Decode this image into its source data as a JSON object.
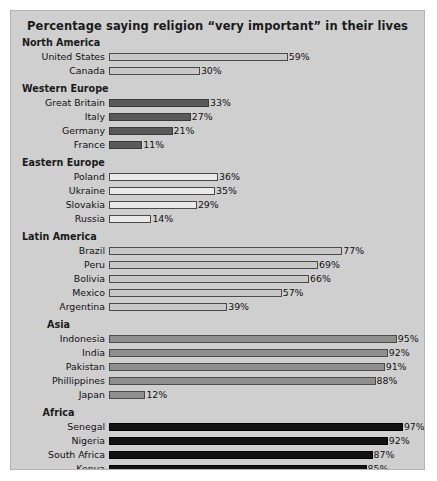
{
  "chart_data": {
    "type": "bar",
    "orientation": "horizontal",
    "title": "Percentage saying religion “very important” in their lives",
    "xlabel": "",
    "ylabel": "",
    "xlim": [
      0,
      100
    ],
    "grid": false,
    "legend": "none",
    "value_suffix": "%",
    "categories": [
      "United States",
      "Canada",
      "Great Britain",
      "Italy",
      "Germany",
      "France",
      "Poland",
      "Ukraine",
      "Slovakia",
      "Russia",
      "Brazil",
      "Peru",
      "Bolivia",
      "Mexico",
      "Argentina",
      "Indonesia",
      "India",
      "Pakistan",
      "Phillippines",
      "Japan",
      "Senegal",
      "Nigeria",
      "South Africa",
      "Kenya",
      "Uganda"
    ],
    "values": [
      59,
      30,
      33,
      27,
      21,
      11,
      36,
      35,
      29,
      14,
      77,
      69,
      66,
      57,
      39,
      95,
      92,
      91,
      88,
      12,
      97,
      92,
      87,
      85,
      85
    ],
    "groups": [
      {
        "name": "North America",
        "heading_align": "left",
        "fill": "fill-light",
        "color": "#c8c8c8",
        "rows": [
          {
            "label": "United States",
            "value": 59,
            "value_label": "59%"
          },
          {
            "label": "Canada",
            "value": 30,
            "value_label": "30%"
          }
        ]
      },
      {
        "name": "Western Europe",
        "heading_align": "left",
        "fill": "fill-dark",
        "color": "#595959",
        "rows": [
          {
            "label": "Great Britain",
            "value": 33,
            "value_label": "33%"
          },
          {
            "label": "Italy",
            "value": 27,
            "value_label": "27%"
          },
          {
            "label": "Germany",
            "value": 21,
            "value_label": "21%"
          },
          {
            "label": "France",
            "value": 11,
            "value_label": "11%"
          }
        ]
      },
      {
        "name": "Eastern Europe",
        "heading_align": "left",
        "fill": "fill-white",
        "color": "#e9e9e9",
        "rows": [
          {
            "label": "Poland",
            "value": 36,
            "value_label": "36%"
          },
          {
            "label": "Ukraine",
            "value": 35,
            "value_label": "35%"
          },
          {
            "label": "Slovakia",
            "value": 29,
            "value_label": "29%"
          },
          {
            "label": "Russia",
            "value": 14,
            "value_label": "14%"
          }
        ]
      },
      {
        "name": "Latin America",
        "heading_align": "left",
        "fill": "fill-light",
        "color": "#c8c8c8",
        "rows": [
          {
            "label": "Brazil",
            "value": 77,
            "value_label": "77%"
          },
          {
            "label": "Peru",
            "value": 69,
            "value_label": "69%"
          },
          {
            "label": "Bolivia",
            "value": 66,
            "value_label": "66%"
          },
          {
            "label": "Mexico",
            "value": 57,
            "value_label": "57%"
          },
          {
            "label": "Argentina",
            "value": 39,
            "value_label": "39%"
          }
        ]
      },
      {
        "name": "Asia",
        "heading_align": "centered",
        "fill": "fill-medium",
        "color": "#8f8f8f",
        "rows": [
          {
            "label": "Indonesia",
            "value": 95,
            "value_label": "95%"
          },
          {
            "label": "India",
            "value": 92,
            "value_label": "92%"
          },
          {
            "label": "Pakistan",
            "value": 91,
            "value_label": "91%"
          },
          {
            "label": "Phillippines",
            "value": 88,
            "value_label": "88%"
          },
          {
            "label": "Japan",
            "value": 12,
            "value_label": "12%"
          }
        ]
      },
      {
        "name": "Africa",
        "heading_align": "centered",
        "fill": "fill-black",
        "color": "#121212",
        "rows": [
          {
            "label": "Senegal",
            "value": 97,
            "value_label": "97%"
          },
          {
            "label": "Nigeria",
            "value": 92,
            "value_label": "92%"
          },
          {
            "label": "South Africa",
            "value": 87,
            "value_label": "87%"
          },
          {
            "label": "Kenya",
            "value": 85,
            "value_label": "85%"
          },
          {
            "label": "Uganda",
            "value": 85,
            "value_label": "85%"
          }
        ]
      }
    ]
  }
}
